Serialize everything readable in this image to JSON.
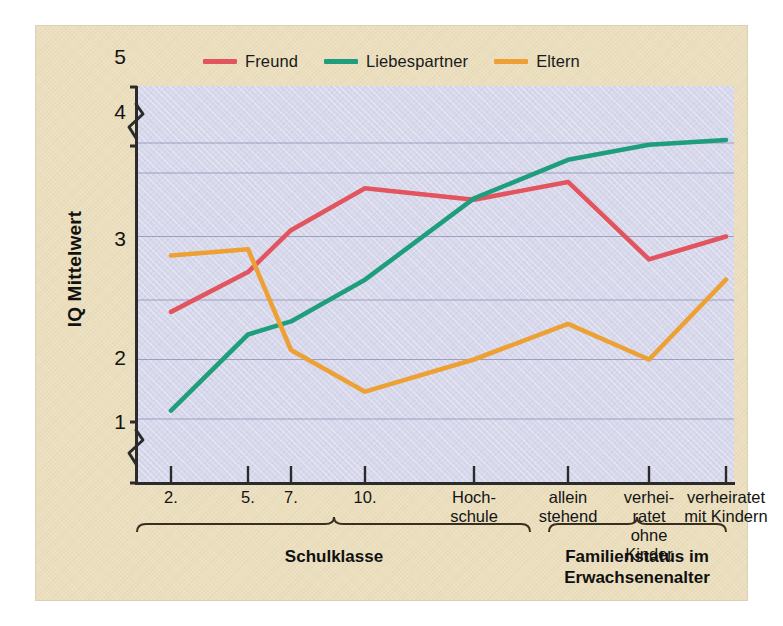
{
  "chart_data": {
    "type": "line",
    "title": "",
    "xlabel": "",
    "ylabel": "IQ Mittelwert",
    "ylim": [
      1,
      5
    ],
    "yticks": [
      1,
      2,
      3,
      4,
      5
    ],
    "ytick_labels": [
      "1",
      "2",
      "3",
      "4",
      "5"
    ],
    "gridlines": [
      2.0,
      2.5,
      3.0,
      3.5,
      4.0,
      4.5
    ],
    "grid": true,
    "y_axis_break": true,
    "legend_position": "top-center",
    "categories": [
      "2.",
      "5.",
      "7.",
      "10.",
      "Hoch-\nschule",
      "allein\nstehend",
      "verhei-\nratet\nohne\nKinder",
      "verheiratet\nmit Kindern"
    ],
    "series": [
      {
        "name": "Freund",
        "color": "#e2555f",
        "values": [
          2.9,
          3.22,
          3.55,
          3.88,
          3.79,
          3.93,
          3.32,
          3.5
        ]
      },
      {
        "name": "Liebespartner",
        "color": "#1f9e7e",
        "values": [
          2.07,
          2.71,
          2.82,
          3.16,
          3.8,
          4.22,
          4.47,
          4.55
        ]
      },
      {
        "name": "Eltern",
        "color": "#eda033",
        "values": [
          3.35,
          3.4,
          2.58,
          2.23,
          2.5,
          2.8,
          2.5,
          3.16
        ]
      }
    ],
    "group_braces": [
      {
        "label": "Schulklasse",
        "from_category": 0,
        "to_category": 4
      },
      {
        "label": "Familienstatus im\nErwachsenenalter",
        "from_category": 5,
        "to_category": 7
      }
    ]
  },
  "legend": {
    "items": [
      {
        "label": "Freund",
        "color": "#e2555f"
      },
      {
        "label": "Liebespartner",
        "color": "#1f9e7e"
      },
      {
        "label": "Eltern",
        "color": "#eda033"
      }
    ]
  },
  "axes": {
    "y_title": "IQ Mittelwert",
    "y_labels": [
      "5",
      "4",
      "3",
      "2",
      "1"
    ],
    "x_labels": [
      "2.",
      "5.",
      "7.",
      "10.",
      "Hoch-\nschule",
      "allein\nstehend",
      "verhei-\nratet\nohne\nKinder",
      "verheiratet\nmit Kindern"
    ]
  },
  "groups": {
    "left_label": "Schulklasse",
    "right_label": "Familienstatus im\nErwachsenenalter"
  },
  "colors": {
    "background": "#ebdfbe",
    "plot_background": "#d8d8ec",
    "axis": "#2b2b2b",
    "grid": "#8b8bb0",
    "freund": "#e2555f",
    "liebespartner": "#1f9e7e",
    "eltern": "#eda033"
  }
}
